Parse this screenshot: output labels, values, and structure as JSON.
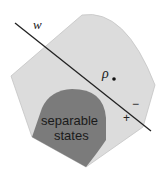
{
  "diagram": {
    "type": "entanglement-witness",
    "regions": {
      "all_states": {
        "label": "",
        "fill": "#dcdcdc",
        "stroke": "#b8b8b8"
      },
      "separable": {
        "label_line1": "separable",
        "label_line2": "states",
        "fill": "#7b7b7b",
        "text_color": "#1a1a1a"
      }
    },
    "hyperplane": {
      "label": "w",
      "color": "#222222"
    },
    "state_point": {
      "label": "ρ"
    },
    "sides": {
      "negative": "−",
      "positive": "+"
    }
  }
}
